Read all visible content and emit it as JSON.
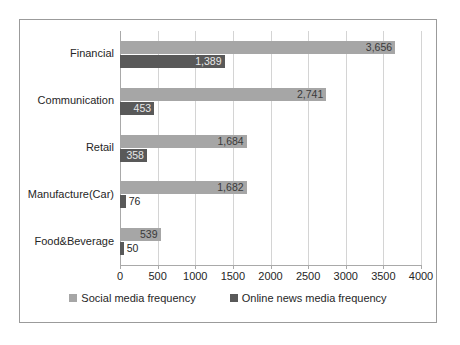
{
  "chart_data": {
    "type": "bar",
    "orientation": "horizontal",
    "title": "",
    "xlabel": "",
    "ylabel": "",
    "xlim": [
      0,
      4000
    ],
    "xticks": [
      0,
      500,
      1000,
      1500,
      2000,
      2500,
      3000,
      3500,
      4000
    ],
    "xtick_labels": [
      "0",
      "500",
      "1000",
      "1500",
      "2000",
      "2500",
      "3000",
      "3500",
      "4000"
    ],
    "grid": true,
    "grid_axis": "x",
    "legend_position": "bottom",
    "categories": [
      "Financial",
      "Communication",
      "Retail",
      "Manufacture(Car)",
      "Food&Beverage"
    ],
    "series": [
      {
        "name": "Social media frequency",
        "color": "#a6a6a6",
        "values": [
          3656,
          2741,
          1684,
          1682,
          539
        ],
        "value_labels": [
          "3,656",
          "2,741",
          "1,684",
          "1,682",
          "539"
        ],
        "label_placement": [
          "inside-light",
          "inside-light",
          "inside-light",
          "inside-light",
          "inside-light"
        ]
      },
      {
        "name": "Online news media frequency",
        "color": "#595959",
        "values": [
          1389,
          453,
          358,
          76,
          50
        ],
        "value_labels": [
          "1,389",
          "453",
          "358",
          "76",
          "50"
        ],
        "label_placement": [
          "inside-dark",
          "inside-dark",
          "inside-dark",
          "outside",
          "outside"
        ]
      }
    ],
    "legend": [
      {
        "label": "Social media frequency",
        "color": "#a6a6a6"
      },
      {
        "label": "Online news media frequency",
        "color": "#595959"
      }
    ]
  },
  "colors": {
    "social": "#a6a6a6",
    "news": "#595959",
    "border": "#9b9b9b",
    "gridline": "#d4d4d4",
    "axis": "#a9a9a9",
    "text": "#262626",
    "background": "#ffffff"
  }
}
